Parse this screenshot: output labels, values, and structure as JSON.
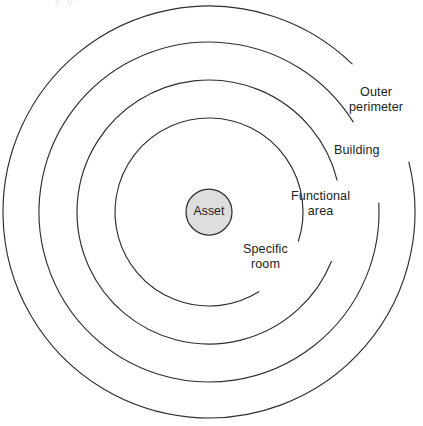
{
  "figure": {
    "type": "concentric-rings-diagram",
    "title": "",
    "background_color": "#ffffff",
    "stroke_color": "#2e2e2e",
    "center": {
      "x": 209,
      "y": 212
    },
    "top_edge_artifact": "y    p",
    "core": {
      "name": "asset-core",
      "label": "Asset",
      "radius": 23,
      "fill_color": "#dedede",
      "stroke_color": "#2e2e2e"
    },
    "rings": [
      {
        "id": "specific-room",
        "label_lines": [
          "Specific",
          "room"
        ],
        "label_text": "Specific room",
        "radius": 94,
        "gap_start_deg": 18,
        "gap_end_deg": 58,
        "label_left": 243,
        "label_top": 242
      },
      {
        "id": "functional-area",
        "label_lines": [
          "Functional",
          "area"
        ],
        "label_text": "Functional area",
        "radius": 132,
        "gap_start_deg": -14,
        "gap_end_deg": 22,
        "label_left": 291,
        "label_top": 189
      },
      {
        "id": "building",
        "label_lines": [
          "Building"
        ],
        "label_text": "Building",
        "radius": 170,
        "gap_start_deg": -32,
        "gap_end_deg": -3,
        "label_left": 334,
        "label_top": 143
      },
      {
        "id": "outer-perimeter",
        "label_lines": [
          "Outer",
          "perimeter"
        ],
        "label_text": "Outer perimeter",
        "radius": 206,
        "gap_start_deg": -46,
        "gap_end_deg": -14,
        "label_left": 349,
        "label_top": 85
      }
    ]
  }
}
